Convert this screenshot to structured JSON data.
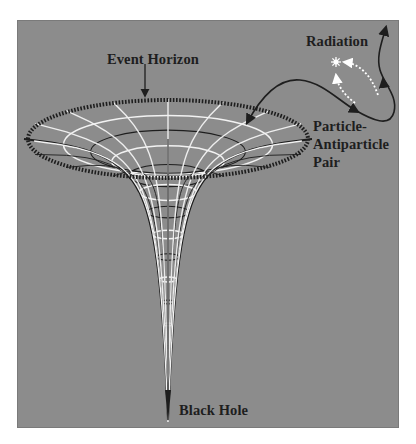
{
  "labels": {
    "event_horizon": "Event Horizon",
    "radiation": "Radiation",
    "pair_line1": "Particle-",
    "pair_line2": "Antiparticle",
    "pair_line3": "Pair",
    "black_hole": "Black Hole"
  },
  "colors": {
    "background": "#8c8c8c",
    "grid_white": "#f2f2f2",
    "grid_dark": "#1e1e1e",
    "text": "#1e1e1e",
    "page": "#ffffff"
  },
  "geometry": {
    "center_x": 168,
    "rim_y": 139,
    "rim_rx": 140,
    "rim_ry": 39,
    "tip_y": 420,
    "horizon_ellipse": {
      "cx": 168,
      "cy": 139,
      "rx": 140,
      "ry": 39
    }
  }
}
